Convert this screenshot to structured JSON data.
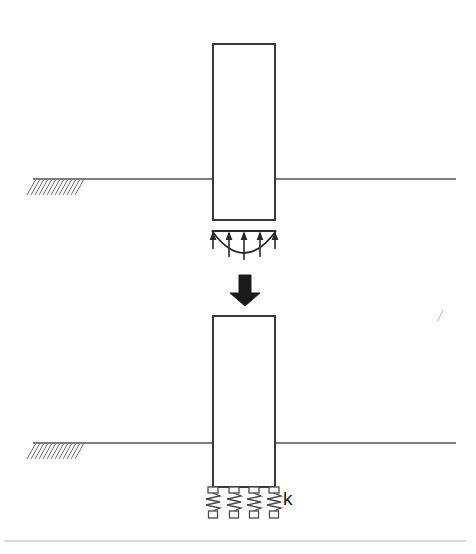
{
  "figure": {
    "canvas": {
      "width": 476,
      "height": 554,
      "background": "#ffffff"
    },
    "colors": {
      "outline": "#3a3a3a",
      "ground_line": "#555555",
      "hatch": "#6a6a6a",
      "solid_arrow": "#1a1a1a",
      "pressure": "#2b2b2b",
      "spring": "#4a4a4a",
      "label": "#1a1a1a",
      "frame": "#b4b4b4"
    }
  },
  "top_panel": {
    "name": "real-soil-reaction-case",
    "column": {
      "label": "column",
      "x": 213,
      "y": 44,
      "width": 62,
      "height": 176,
      "stroke_width": 2
    },
    "ground": {
      "label": "ground-surface",
      "y": 179,
      "x_start": 33,
      "x_end": 456,
      "hatch": {
        "x_start": 36,
        "x_end": 86,
        "count": 13,
        "drop": 16,
        "slant": 9
      }
    },
    "pressure_diagram": {
      "label": "soil-bearing-pressure-distribution",
      "top_y": 231,
      "x_left": 212,
      "x_right": 276,
      "curve_depth": 28,
      "arrows": {
        "count": 5,
        "positions": [
          213,
          229,
          244,
          260,
          275
        ],
        "direction": "up",
        "lengths": [
          16,
          24,
          27,
          24,
          16
        ]
      }
    }
  },
  "transition": {
    "name": "idealization-arrow",
    "label": "idealize as",
    "arrow": {
      "x_center": 245,
      "y_top": 275,
      "y_bottom": 306,
      "shaft_width": 12,
      "head_width": 30,
      "head_height": 13
    }
  },
  "bottom_panel": {
    "name": "spring-idealized-case",
    "column": {
      "label": "column",
      "x": 213,
      "y": 316,
      "width": 62,
      "height": 171,
      "stroke_width": 2
    },
    "ground": {
      "label": "ground-surface",
      "y": 443,
      "x_start": 33,
      "x_end": 456,
      "hatch": {
        "x_start": 36,
        "x_end": 86,
        "count": 13,
        "drop": 16,
        "slant": 9
      }
    },
    "springs": {
      "label": "elastic-support-springs",
      "count": 4,
      "x_positions": [
        213,
        234,
        254,
        274
      ],
      "top_y": 489,
      "bottom_y": 513,
      "coils": 4,
      "amplitude": 7,
      "pad": {
        "width": 10,
        "height": 6
      },
      "base": {
        "width": 9,
        "height": 7
      }
    },
    "stiffness_label": {
      "text": "k",
      "x": 283,
      "y": 505
    }
  },
  "artifacts": {
    "scan_mark": {
      "name": "scan-speck",
      "x": 441,
      "y": 315
    },
    "bottom_rule": {
      "name": "page-rule",
      "y": 541,
      "x_start": 4,
      "x_end": 466
    }
  }
}
